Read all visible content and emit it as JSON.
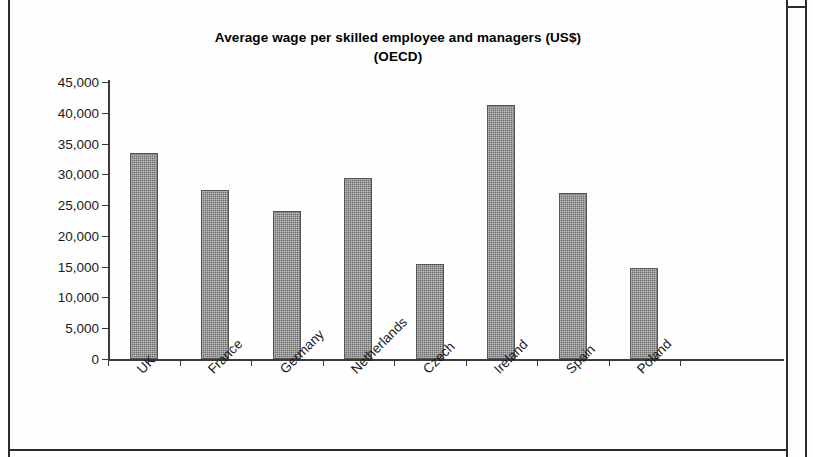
{
  "chart_data": {
    "type": "bar",
    "title": "Average wage per skilled employee and managers (US$)",
    "subtitle": "(OECD)",
    "xlabel": "",
    "ylabel": "",
    "ylim": [
      0,
      45000
    ],
    "ytick_labels": [
      "45,000",
      "40,000",
      "35,000",
      "30,000",
      "25,000",
      "20,000",
      "15,000",
      "10,000",
      "5,000",
      "0"
    ],
    "ytick_values": [
      45000,
      40000,
      35000,
      30000,
      25000,
      20000,
      15000,
      10000,
      5000,
      0
    ],
    "grid": false,
    "legend": "none",
    "categories": [
      "UK",
      "France",
      "Germany",
      "Netherlands",
      "Czech",
      "Ireland",
      "Spain",
      "Poland"
    ],
    "values": [
      33500,
      27500,
      24100,
      29400,
      15400,
      41300,
      27000,
      14800
    ],
    "series": [
      {
        "name": "Average wage",
        "values": [
          33500,
          27500,
          24100,
          29400,
          15400,
          41300,
          27000,
          14800
        ],
        "color": "#6f6f6f"
      }
    ]
  },
  "colors": {
    "bar_fill": "#6f6f6f",
    "axis": "#3a3a3a",
    "text": "#1a1a1a",
    "frame": "#2b2b2b",
    "background": "#ffffff"
  }
}
